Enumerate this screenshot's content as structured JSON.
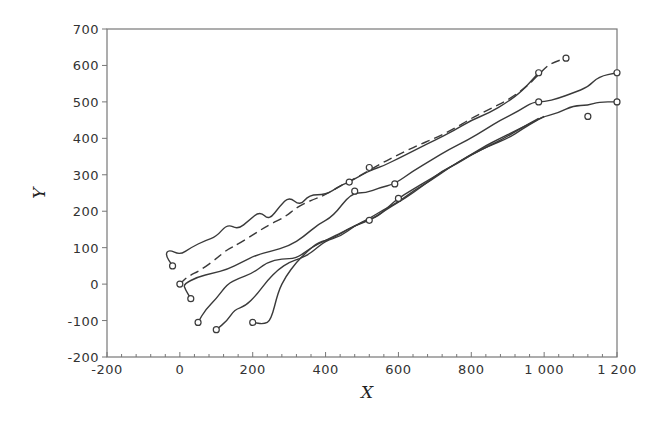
{
  "chart_data": {
    "type": "line",
    "title": "",
    "xlabel": "X",
    "ylabel": "Y",
    "xlim": [
      -200,
      1200
    ],
    "ylim": [
      -200,
      700
    ],
    "x_ticks": [
      -200,
      0,
      200,
      400,
      600,
      800,
      1000,
      1200
    ],
    "x_tick_labels": [
      "-200",
      "0",
      "200",
      "400",
      "600",
      "800",
      "1 000",
      "1 200"
    ],
    "y_ticks": [
      -200,
      -100,
      0,
      100,
      200,
      300,
      400,
      500,
      600,
      700
    ],
    "y_tick_labels": [
      "-200",
      "-100",
      "0",
      "100",
      "200",
      "300",
      "400",
      "500",
      "600",
      "700"
    ],
    "grid": false,
    "legend": null,
    "marker": "open-circle",
    "series": [
      {
        "name": "trajectory-1",
        "style": "solid",
        "points": [
          [
            -20,
            50
          ],
          [
            -40,
            80
          ],
          [
            -30,
            95
          ],
          [
            0,
            80
          ],
          [
            30,
            100
          ],
          [
            70,
            120
          ],
          [
            100,
            130
          ],
          [
            130,
            165
          ],
          [
            160,
            150
          ],
          [
            190,
            175
          ],
          [
            220,
            200
          ],
          [
            245,
            175
          ],
          [
            275,
            215
          ],
          [
            300,
            240
          ],
          [
            330,
            215
          ],
          [
            355,
            245
          ],
          [
            400,
            245
          ],
          [
            440,
            270
          ],
          [
            465,
            280
          ],
          [
            500,
            300
          ],
          [
            530,
            315
          ],
          [
            560,
            325
          ],
          [
            600,
            345
          ],
          [
            650,
            370
          ],
          [
            700,
            395
          ],
          [
            750,
            420
          ],
          [
            800,
            450
          ],
          [
            850,
            470
          ],
          [
            900,
            500
          ],
          [
            940,
            530
          ],
          [
            985,
            580
          ]
        ]
      },
      {
        "name": "trajectory-2",
        "style": "dashed",
        "points": [
          [
            0,
            0
          ],
          [
            20,
            20
          ],
          [
            60,
            40
          ],
          [
            100,
            70
          ],
          [
            130,
            95
          ],
          [
            160,
            110
          ],
          [
            200,
            135
          ],
          [
            240,
            160
          ],
          [
            290,
            185
          ],
          [
            320,
            210
          ],
          [
            360,
            230
          ],
          [
            400,
            245
          ],
          [
            450,
            275
          ],
          [
            500,
            300
          ],
          [
            550,
            330
          ],
          [
            600,
            355
          ],
          [
            650,
            380
          ],
          [
            700,
            400
          ],
          [
            750,
            425
          ],
          [
            800,
            455
          ],
          [
            850,
            480
          ],
          [
            900,
            505
          ],
          [
            950,
            540
          ],
          [
            985,
            575
          ],
          [
            1010,
            600
          ],
          [
            1030,
            610
          ],
          [
            1060,
            620
          ]
        ]
      },
      {
        "name": "trajectory-3",
        "style": "solid",
        "points": [
          [
            30,
            -40
          ],
          [
            15,
            -15
          ],
          [
            10,
            0
          ],
          [
            50,
            20
          ],
          [
            90,
            30
          ],
          [
            130,
            40
          ],
          [
            170,
            60
          ],
          [
            210,
            80
          ],
          [
            250,
            90
          ],
          [
            300,
            105
          ],
          [
            340,
            130
          ],
          [
            380,
            165
          ],
          [
            420,
            185
          ],
          [
            470,
            250
          ],
          [
            510,
            250
          ],
          [
            550,
            265
          ],
          [
            590,
            275
          ],
          [
            640,
            310
          ],
          [
            690,
            340
          ],
          [
            740,
            370
          ],
          [
            790,
            395
          ],
          [
            840,
            425
          ],
          [
            880,
            450
          ],
          [
            930,
            475
          ],
          [
            970,
            500
          ],
          [
            1000,
            500
          ],
          [
            1040,
            510
          ],
          [
            1080,
            525
          ],
          [
            1120,
            540
          ],
          [
            1150,
            570
          ],
          [
            1200,
            580
          ]
        ]
      },
      {
        "name": "trajectory-4",
        "style": "solid",
        "points": [
          [
            50,
            -105
          ],
          [
            70,
            -70
          ],
          [
            100,
            -40
          ],
          [
            130,
            0
          ],
          [
            160,
            15
          ],
          [
            200,
            30
          ],
          [
            240,
            60
          ],
          [
            280,
            70
          ],
          [
            320,
            70
          ],
          [
            360,
            100
          ],
          [
            400,
            120
          ],
          [
            450,
            145
          ],
          [
            480,
            160
          ],
          [
            520,
            175
          ],
          [
            560,
            200
          ],
          [
            600,
            225
          ],
          [
            640,
            250
          ],
          [
            680,
            280
          ],
          [
            720,
            310
          ],
          [
            760,
            330
          ],
          [
            800,
            355
          ],
          [
            850,
            380
          ],
          [
            900,
            400
          ],
          [
            940,
            425
          ],
          [
            980,
            450
          ],
          [
            1000,
            460
          ],
          [
            1040,
            470
          ],
          [
            1080,
            490
          ],
          [
            1120,
            490
          ],
          [
            1150,
            500
          ],
          [
            1200,
            500
          ]
        ]
      },
      {
        "name": "trajectory-5",
        "style": "solid",
        "points": [
          [
            100,
            -125
          ],
          [
            130,
            -100
          ],
          [
            150,
            -70
          ],
          [
            180,
            -60
          ],
          [
            210,
            -30
          ],
          [
            240,
            10
          ],
          [
            270,
            40
          ],
          [
            300,
            60
          ],
          [
            330,
            70
          ],
          [
            360,
            85
          ],
          [
            400,
            120
          ],
          [
            440,
            130
          ],
          [
            480,
            160
          ],
          [
            520,
            180
          ],
          [
            560,
            205
          ],
          [
            600,
            225
          ],
          [
            640,
            255
          ],
          [
            690,
            285
          ],
          [
            740,
            320
          ],
          [
            790,
            350
          ],
          [
            840,
            380
          ],
          [
            880,
            400
          ],
          [
            920,
            420
          ],
          [
            960,
            440
          ],
          [
            1000,
            460
          ]
        ]
      },
      {
        "name": "trajectory-6",
        "style": "solid",
        "points": [
          [
            200,
            -105
          ],
          [
            230,
            -110
          ],
          [
            250,
            -100
          ],
          [
            270,
            -20
          ],
          [
            290,
            20
          ],
          [
            320,
            60
          ],
          [
            350,
            90
          ],
          [
            380,
            115
          ],
          [
            420,
            125
          ],
          [
            460,
            150
          ],
          [
            500,
            170
          ],
          [
            545,
            185
          ],
          [
            590,
            230
          ],
          [
            640,
            260
          ],
          [
            690,
            290
          ],
          [
            740,
            320
          ],
          [
            790,
            350
          ],
          [
            840,
            375
          ],
          [
            890,
            400
          ],
          [
            940,
            430
          ],
          [
            985,
            455
          ]
        ]
      }
    ],
    "markers": [
      [
        -20,
        50
      ],
      [
        0,
        0
      ],
      [
        30,
        -40
      ],
      [
        50,
        -105
      ],
      [
        100,
        -125
      ],
      [
        200,
        -105
      ],
      [
        465,
        280
      ],
      [
        480,
        255
      ],
      [
        520,
        320
      ],
      [
        520,
        175
      ],
      [
        590,
        275
      ],
      [
        600,
        235
      ],
      [
        985,
        580
      ],
      [
        1060,
        620
      ],
      [
        1200,
        580
      ],
      [
        985,
        500
      ],
      [
        1120,
        460
      ],
      [
        1200,
        500
      ]
    ]
  }
}
